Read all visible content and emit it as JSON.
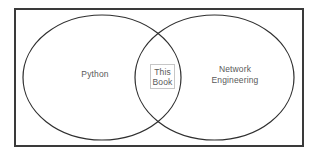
{
  "figure": {
    "type": "venn-diagram",
    "title": "",
    "background_color": "#ffffff",
    "frame_color": "#3a3a3a",
    "circle_stroke_color": "#2f2f2f",
    "label_text_color": "#595959",
    "center_box_border_color": "#c6c6c6"
  },
  "diagram": {
    "outer_frame": {
      "name": "outer-frame",
      "x": 15,
      "y": 9,
      "width": 288,
      "height": 137,
      "stroke_width": 2
    },
    "sets": [
      {
        "id": "left",
        "label": "Python",
        "cx": 102,
        "cy": 77.5,
        "rx": 79,
        "ry": 62.5,
        "stroke_width": 1.2
      },
      {
        "id": "right",
        "label": "Network\nEngineering",
        "cx": 214.5,
        "cy": 77.5,
        "rx": 79.5,
        "ry": 62.5,
        "stroke_width": 1.2
      }
    ],
    "intersection": {
      "id": "center",
      "label_line_1": "This",
      "label_line_2": "Book",
      "box": {
        "x": 150,
        "y": 64,
        "width": 25,
        "height": 25
      }
    }
  }
}
